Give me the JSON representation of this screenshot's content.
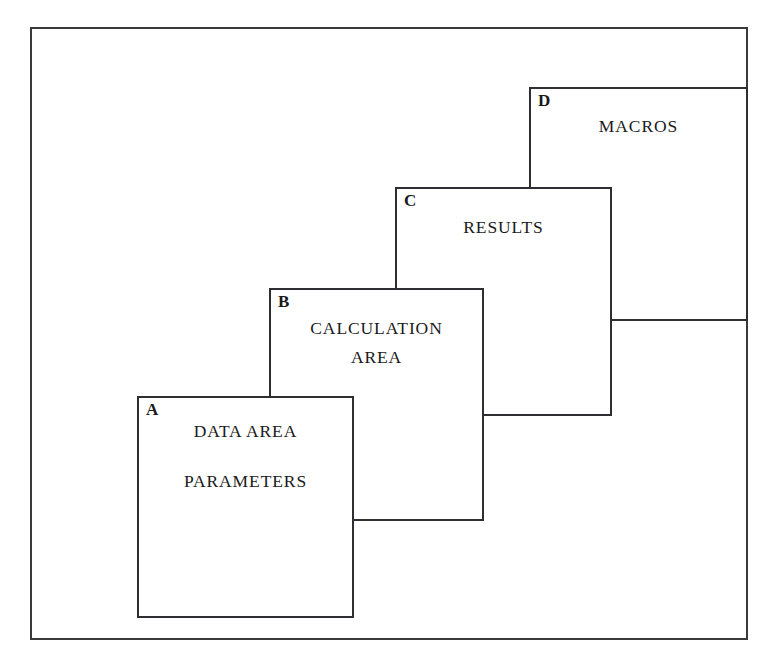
{
  "diagram": {
    "type": "cascading-layered-panels",
    "frame": {
      "label": "outer-border"
    },
    "panels": [
      {
        "key": "D",
        "lines": [
          "MACROS"
        ],
        "depth": 1,
        "position": "back"
      },
      {
        "key": "C",
        "lines": [
          "RESULTS"
        ],
        "depth": 2,
        "position": "upper-middle"
      },
      {
        "key": "B",
        "lines": [
          "CALCULATION",
          "AREA"
        ],
        "depth": 3,
        "position": "lower-middle"
      },
      {
        "key": "A",
        "lines": [
          "DATA AREA",
          "PARAMETERS"
        ],
        "depth": 4,
        "position": "front"
      }
    ],
    "colors": {
      "background": "#ffffff",
      "frame_stroke": "#3a3a3c",
      "panel_stroke": "#2f2f33",
      "text": "#1a1a1a"
    }
  }
}
